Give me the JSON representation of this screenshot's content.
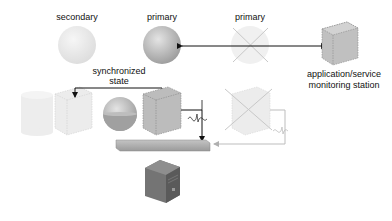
{
  "labels": {
    "secondary": "secondary",
    "primary_left": "primary",
    "primary_right": "primary",
    "monitor_line1": "application/service",
    "monitor_line2": "monitoring station",
    "sync_line1": "synchronized",
    "sync_line2": "state"
  },
  "colors": {
    "sphere_faded": "#e6e6e6",
    "sphere_primary": "#b4b4b4",
    "cube_gray": "#b8b8b8",
    "cube_faded": "#e8e8e8",
    "bar": "#a8a8a8",
    "server": "#6e6e6e",
    "line_dark": "#111111",
    "line_faded": "#bdbdbd",
    "fill_liquid": "#9c9c9c"
  }
}
